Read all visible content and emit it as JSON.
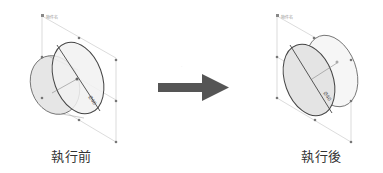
{
  "before": {
    "caption": "執行前",
    "corner_label": "物件名",
    "dim_label": "Ø40"
  },
  "after": {
    "caption": "執行後",
    "corner_label": "物件名",
    "dim_label": "Ø40"
  },
  "arrow": {
    "color": "#555555",
    "direction": "right"
  },
  "colors": {
    "outline": "#555555",
    "fill": "#e6e6e6",
    "guide": "#bbbbbb",
    "handle": "#777777"
  }
}
